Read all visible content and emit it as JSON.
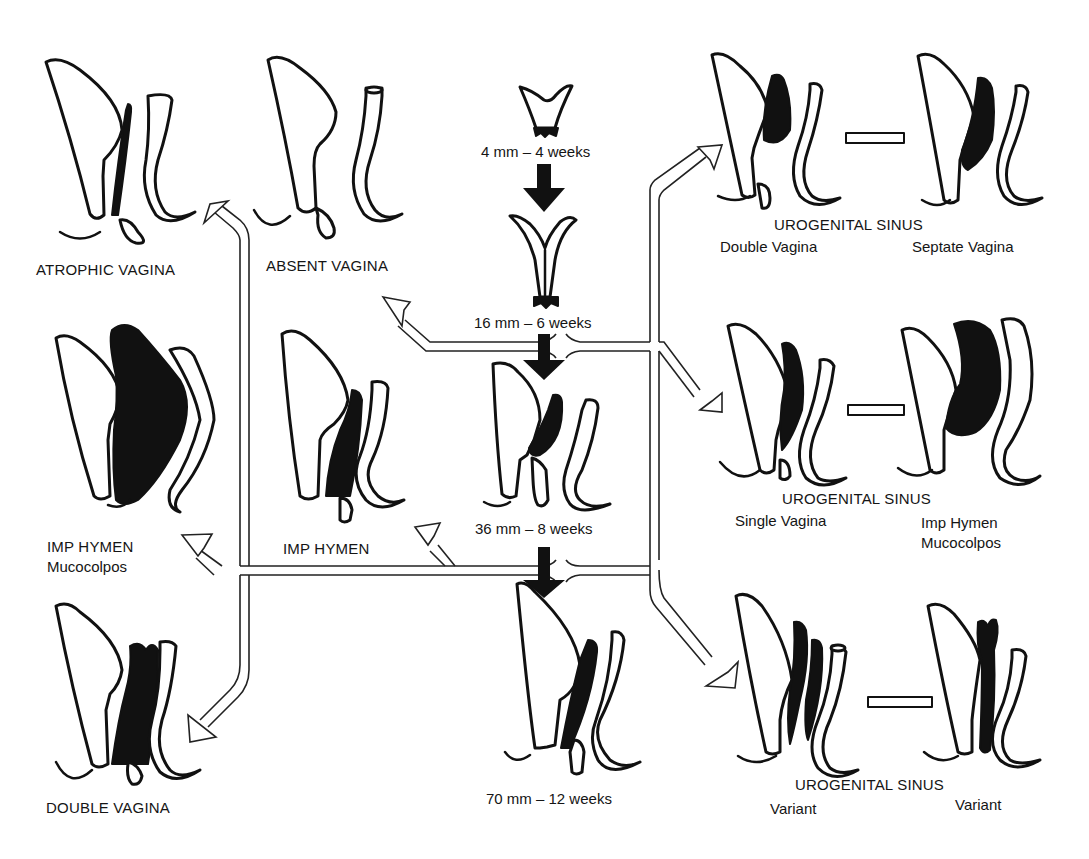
{
  "figure": {
    "central_stages": [
      {
        "id": "stage1",
        "label": "4 mm – 4 weeks"
      },
      {
        "id": "stage2",
        "label": "16 mm – 6 weeks"
      },
      {
        "id": "stage3",
        "label": "36 mm – 8 weeks"
      },
      {
        "id": "stage4",
        "label": "70 mm – 12 weeks"
      }
    ],
    "left_anomalies": [
      {
        "id": "atrophic",
        "label": "ATROPHIC VAGINA"
      },
      {
        "id": "absent",
        "label": "ABSENT VAGINA"
      },
      {
        "id": "imp_hymen_mucocolpos",
        "label": "IMP HYMEN",
        "sublabel": "Mucocolpos"
      },
      {
        "id": "imp_hymen",
        "label": "IMP HYMEN"
      },
      {
        "id": "double",
        "label": "DOUBLE VAGINA"
      }
    ],
    "right_groups": [
      {
        "id": "ugs1",
        "title": "UROGENITAL SINUS",
        "left": "Double Vagina",
        "right": "Septate Vagina"
      },
      {
        "id": "ugs2",
        "title": "UROGENITAL SINUS",
        "left": "Single Vagina",
        "right_line1": "Imp Hymen",
        "right_line2": "Mucocolpos"
      },
      {
        "id": "ugs3",
        "title": "UROGENITAL SINUS",
        "left": "Variant",
        "right": "Variant"
      }
    ],
    "icons": {
      "stage_arrow": "solid-down-arrow",
      "branch_arrow": "hollow-outline-arrow",
      "equivalence": "hollow-bar"
    },
    "colors": {
      "ink": "#111111",
      "background": "#ffffff"
    }
  }
}
